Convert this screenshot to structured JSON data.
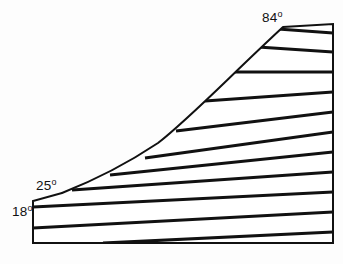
{
  "figure": {
    "name": "wedge-cross-section-diagram",
    "background_color": "#fdfdfd",
    "outline_color": "#111111",
    "hatch_color": "#111111",
    "fill_color": "#ffffff",
    "outline_width": 2,
    "hatch_width": 3.2
  },
  "labels": {
    "bottom_left": {
      "value": "18",
      "degree": "o",
      "x": 12,
      "y": 216
    },
    "mid_left": {
      "value": "25",
      "degree": "o",
      "x": 36,
      "y": 190
    },
    "top_right": {
      "value": "84",
      "degree": "o",
      "x": 262,
      "y": 22
    }
  },
  "chart_data": {
    "type": "line",
    "title": "",
    "xlabel": "",
    "ylabel": "",
    "grid": false,
    "legend": null,
    "annotations": [
      "18o",
      "25o",
      "84o"
    ],
    "series": [
      {
        "name": "outline-boundary",
        "closed": true,
        "points": [
          [
            33,
            201
          ],
          [
            62,
            193
          ],
          [
            283,
            27
          ],
          [
            333,
            24
          ],
          [
            333,
            243
          ],
          [
            33,
            243
          ]
        ]
      },
      {
        "name": "concave-curve-edge",
        "closed": false,
        "description": "curved boundary from 25-degree vertex up to 84-degree vertex",
        "points": [
          [
            62,
            193
          ],
          [
            95,
            180
          ],
          [
            128,
            163
          ],
          [
            158,
            143
          ],
          [
            186,
            120
          ],
          [
            212,
            95
          ],
          [
            236,
            70
          ],
          [
            260,
            46
          ],
          [
            283,
            27
          ]
        ]
      }
    ],
    "hatching": {
      "description": "parallel section-hatch lines running lower-left to upper-right, terminating on the right vertical edge",
      "count": 11,
      "right_edge_x": 333,
      "right_edge_y_values": [
        33,
        52,
        72,
        92,
        112,
        132,
        152,
        172,
        192,
        212,
        232
      ],
      "left_endpoints": [
        [
          278,
          29
        ],
        [
          258,
          47
        ],
        [
          232,
          72
        ],
        [
          205,
          101
        ],
        [
          176,
          131
        ],
        [
          145,
          158
        ],
        [
          110,
          175
        ],
        [
          72,
          190
        ],
        [
          33,
          207
        ],
        [
          33,
          228
        ],
        [
          103,
          243
        ]
      ]
    }
  }
}
